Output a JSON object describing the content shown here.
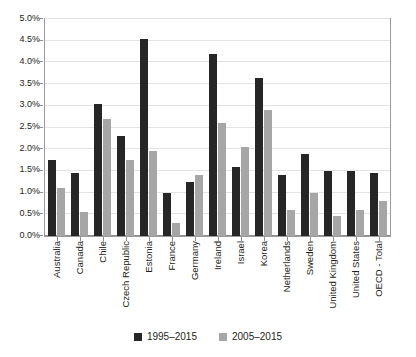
{
  "chart_data": {
    "type": "bar",
    "title": "",
    "subtitle": "",
    "xlabel": "",
    "ylabel": "",
    "ylim": [
      0,
      5
    ],
    "ytick_step": 0.5,
    "ytick_labels": [
      "0.0%",
      "0.5%",
      "1.0%",
      "1.5%",
      "2.0%",
      "2.5%",
      "3.0%",
      "3.5%",
      "4.0%",
      "4.5%",
      "5.0%"
    ],
    "ytick_values": [
      0,
      0.5,
      1.0,
      1.5,
      2.0,
      2.5,
      3.0,
      3.5,
      4.0,
      4.5,
      5.0
    ],
    "grid": true,
    "grid_axis": "y",
    "legend_position": "bottom",
    "value_unit": "%",
    "categories": [
      "Australia",
      "Canada",
      "Chile",
      "Czech Republic",
      "Estonia",
      "France",
      "Germany",
      "Ireland",
      "Israel",
      "Korea",
      "Netherlands",
      "Sweden",
      "United Kingdom",
      "United States",
      "OECD - Total"
    ],
    "series": [
      {
        "name": "1995–2015",
        "color": "#262626",
        "values": [
          1.75,
          1.45,
          3.05,
          2.3,
          4.55,
          1.0,
          1.25,
          4.2,
          1.6,
          3.65,
          1.4,
          1.9,
          1.5,
          1.5,
          1.45
        ]
      },
      {
        "name": "2005–2015",
        "color": "#a6a6a6",
        "values": [
          1.1,
          0.55,
          2.7,
          1.75,
          1.95,
          0.3,
          1.4,
          2.6,
          2.05,
          2.9,
          0.6,
          1.0,
          0.45,
          0.6,
          0.8
        ]
      }
    ]
  },
  "legend": {
    "items": [
      {
        "label": "1995–2015",
        "color": "#262626"
      },
      {
        "label": "2005–2015",
        "color": "#a6a6a6"
      }
    ]
  },
  "colors": {
    "series_1995_2015": "#262626",
    "series_2005_2015": "#a6a6a6",
    "gridline": "#e3e3e3",
    "axis": "#8f8f8f",
    "text": "#231f20",
    "background": "#ffffff"
  }
}
